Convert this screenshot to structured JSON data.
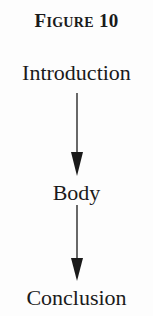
{
  "figure": {
    "title_initial": "F",
    "title_rest": "IGURE",
    "title_number": "10",
    "title_full": "FIGURE 10"
  },
  "diagram": {
    "type": "vertical-flow",
    "nodes": [
      {
        "id": "introduction",
        "label": "Introduction"
      },
      {
        "id": "body",
        "label": "Body"
      },
      {
        "id": "conclusion",
        "label": "Conclusion"
      }
    ],
    "edges": [
      {
        "from": "introduction",
        "to": "body",
        "style": "solid-arrow"
      },
      {
        "from": "body",
        "to": "conclusion",
        "style": "solid-arrow"
      }
    ],
    "colors": {
      "stroke": "#1a1a1a",
      "background": "#fdfdfd"
    }
  }
}
